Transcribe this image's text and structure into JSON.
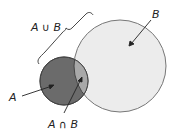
{
  "diagram": {
    "type": "venn",
    "labels": {
      "union": "A ∪ B",
      "set_a": "A",
      "set_b": "B",
      "intersection": "A ∩ B"
    },
    "colors": {
      "set_a_fill": "#6b6b6b",
      "set_b_fill": "#ececec",
      "intersection_fill": "#a8a8a8",
      "stroke": "#555555",
      "label": "#222222"
    },
    "circles": {
      "a": {
        "cx": 64,
        "cy": 81,
        "r": 24
      },
      "b": {
        "cx": 120,
        "cy": 66,
        "r": 46
      }
    }
  }
}
